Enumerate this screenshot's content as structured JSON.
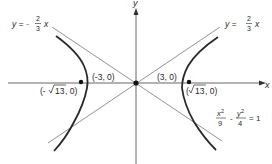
{
  "figure": {
    "equation": {
      "x_term_num": "x",
      "x_term_exp": "2",
      "x_term_den": "9",
      "minus": "-",
      "y_term_num": "y",
      "y_term_exp": "2",
      "y_term_den": "4",
      "equals": "= 1"
    },
    "axes": {
      "x_label": "x",
      "y_label": "y"
    },
    "asymptotes": [
      {
        "lhs": "y = -",
        "num": "2",
        "den": "3",
        "var": "x"
      },
      {
        "lhs": "y =",
        "num": "2",
        "den": "3",
        "var": "x"
      }
    ],
    "vertices": [
      {
        "label": "(-3, 0)"
      },
      {
        "label": "(3, 0)"
      }
    ],
    "foci": [
      {
        "open": "(-",
        "radicand": "13",
        "close": ", 0)"
      },
      {
        "open": "(",
        "radicand": "13",
        "close": ", 0)"
      }
    ],
    "colors": {
      "curve": "#2a2a2a",
      "axis": "#555555",
      "asymptote": "#666666",
      "text": "#2a2a2a"
    }
  }
}
